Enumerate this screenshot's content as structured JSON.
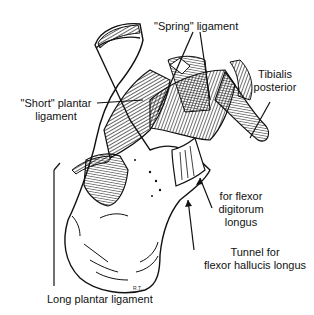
{
  "figure": {
    "labels": {
      "spring_ligament": "\"Spring\" ligament",
      "tibialis_posterior_line1": "Tibialis",
      "tibialis_posterior_line2": "posterior",
      "short_plantar_line1": "\"Short\" plantar",
      "short_plantar_line2": "ligament",
      "fdl_line1": "for flexor",
      "fdl_line2": "digitorum",
      "fdl_line3": "longus",
      "fhl_line1": "Tunnel for",
      "fhl_line2": "flexor hallucis longus",
      "long_plantar": "Long plantar ligament"
    },
    "signature": "R.T.",
    "colors": {
      "ink": "#111111",
      "background": "#ffffff"
    }
  }
}
